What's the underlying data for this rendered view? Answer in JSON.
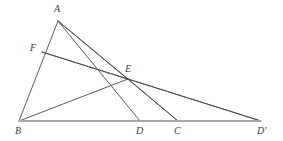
{
  "figure": {
    "background_color": "#ffffff",
    "line_color": "#4a4a4a",
    "baseline_color": "#a8a8a8",
    "label_color": "#3a3a3a",
    "width": 283,
    "height": 141
  },
  "points": [
    {
      "name": "A",
      "label": "A",
      "x": 58,
      "y": 21,
      "label_x": 54,
      "label_y": 4
    },
    {
      "name": "F",
      "label": "F",
      "x": 42,
      "y": 52,
      "label_x": 30,
      "label_y": 43
    },
    {
      "name": "E",
      "label": "E",
      "x": 128,
      "y": 79,
      "label_x": 125,
      "label_y": 64
    },
    {
      "name": "B",
      "label": "B",
      "x": 19,
      "y": 121,
      "label_x": 15,
      "label_y": 126
    },
    {
      "name": "D",
      "label": "D",
      "x": 140,
      "y": 121,
      "label_x": 136,
      "label_y": 126
    },
    {
      "name": "C",
      "label": "C",
      "x": 178,
      "y": 121,
      "label_x": 174,
      "label_y": 126
    },
    {
      "name": "Dp",
      "label": "D′",
      "x": 261,
      "y": 121,
      "label_x": 257,
      "label_y": 126
    }
  ],
  "segments": [
    {
      "name": "segment-A-B",
      "from": "A",
      "to": "B",
      "kind": "side",
      "width": 0.9
    },
    {
      "name": "segment-A-E",
      "from": "A",
      "to": "E",
      "kind": "cevian",
      "width": 0.9
    },
    {
      "name": "segment-A-D",
      "from": "A",
      "to": "D",
      "kind": "cevian",
      "width": 0.9
    },
    {
      "name": "segment-A-C",
      "from": "A",
      "to": "C",
      "kind": "side",
      "width": 0.9
    },
    {
      "name": "segment-F-E",
      "from": "F",
      "to": "E",
      "kind": "cevian",
      "width": 0.9
    },
    {
      "name": "segment-F-Dp",
      "from": "F",
      "to": "Dp",
      "kind": "cevian",
      "width": 0.9
    },
    {
      "name": "segment-B-E",
      "from": "B",
      "to": "E",
      "kind": "cevian",
      "width": 0.9
    },
    {
      "name": "segment-E-C",
      "from": "E",
      "to": "C",
      "kind": "cevian",
      "width": 0.9
    },
    {
      "name": "segment-E-Dp",
      "from": "E",
      "to": "Dp",
      "kind": "cevian",
      "width": 0.9
    },
    {
      "name": "segment-B-Dp",
      "from": "B",
      "to": "Dp",
      "kind": "baseline",
      "width": 2.2
    }
  ]
}
